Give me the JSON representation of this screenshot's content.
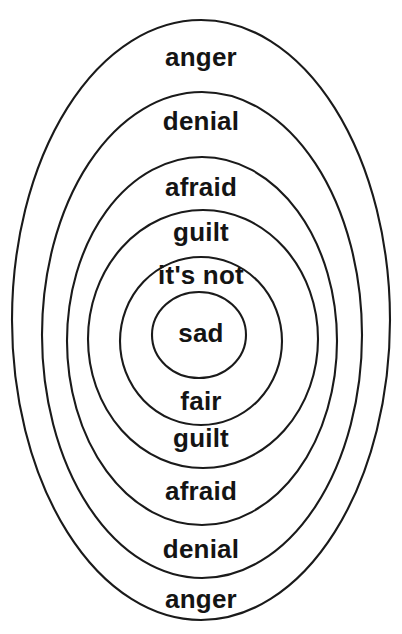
{
  "diagram": {
    "type": "concentric-ellipses",
    "background_color": "#ffffff",
    "stroke_color": "#1a1a1a",
    "text_color": "#141414",
    "canvas": {
      "width": 402,
      "height": 634
    },
    "center": {
      "x": 201,
      "y": 320
    },
    "rings": [
      {
        "index": 1,
        "name": "anger",
        "top_label": "anger",
        "bottom_label": "anger",
        "cx": 201,
        "cy": 320,
        "rx": 189,
        "ry": 300,
        "top_label_y": 44,
        "bottom_label_y": 586,
        "font_size": 26
      },
      {
        "index": 2,
        "name": "denial",
        "top_label": "denial",
        "bottom_label": "denial",
        "cx": 202,
        "cy": 335,
        "rx": 160,
        "ry": 243,
        "top_label_y": 108,
        "bottom_label_y": 536,
        "font_size": 26
      },
      {
        "index": 3,
        "name": "afraid",
        "top_label": "afraid",
        "bottom_label": "afraid",
        "cx": 202,
        "cy": 341,
        "rx": 135,
        "ry": 184,
        "top_label_y": 174,
        "bottom_label_y": 478,
        "font_size": 26
      },
      {
        "index": 4,
        "name": "guilt",
        "top_label": "guilt",
        "bottom_label": "guilt",
        "cx": 203,
        "cy": 339,
        "rx": 115,
        "ry": 129,
        "top_label_y": 219,
        "bottom_label_y": 425,
        "font_size": 26
      },
      {
        "index": 5,
        "name": "its-not-fair",
        "top_label": "it's not",
        "bottom_label": "fair",
        "cx": 201,
        "cy": 341,
        "rx": 81,
        "ry": 84,
        "top_label_y": 262,
        "bottom_label_y": 388,
        "font_size": 26
      },
      {
        "index": 6,
        "name": "sad",
        "top_label": "sad",
        "bottom_label": "",
        "cx": 199,
        "cy": 335,
        "rx": 47,
        "ry": 43,
        "top_label_y": 320,
        "bottom_label_y": 0,
        "font_size": 26
      }
    ]
  }
}
